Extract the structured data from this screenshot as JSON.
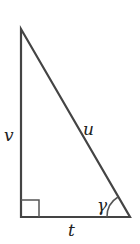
{
  "diagram": {
    "type": "right-triangle",
    "labels": {
      "vertical_side": "v",
      "hypotenuse": "u",
      "horizontal_side": "t",
      "angle": "γ"
    },
    "right_angle_marker": "square at bottom-left",
    "stroke_color": "#444444"
  }
}
